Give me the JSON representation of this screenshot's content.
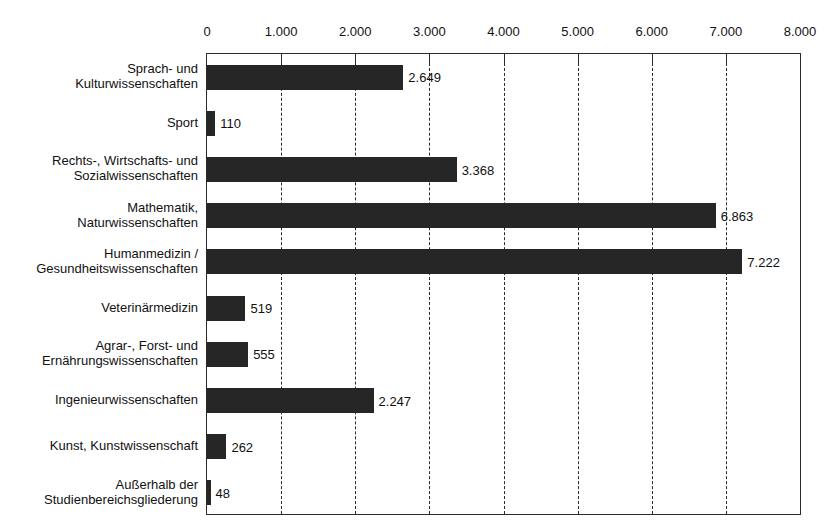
{
  "chart_data": {
    "type": "bar",
    "orientation": "horizontal",
    "title": "",
    "subtitle": "",
    "xlabel": "",
    "ylabel": "",
    "xlim": [
      0,
      8000
    ],
    "grid": true,
    "grid_axis": "x",
    "legend": false,
    "bar_color": "#262626",
    "frame_color": "#2a2a2a",
    "xticks": [
      0,
      1000,
      2000,
      3000,
      4000,
      5000,
      6000,
      7000,
      8000
    ],
    "xtick_labels": [
      "0",
      "1.000",
      "2.000",
      "3.000",
      "4.000",
      "5.000",
      "6.000",
      "7.000",
      "8.000"
    ],
    "categories": [
      "Sprach- und Kulturwissenschaften",
      "Sport",
      "Rechts-, Wirtschafts- und Sozialwissenschaften",
      "Mathematik, Naturwissenschaften",
      "Humanmedizin / Gesundheitswissenschaften",
      "Veterinärmedizin",
      "Agrar-, Forst- und Ernährungswissenschaften",
      "Ingenieurwissenschaften",
      "Kunst, Kunstwissenschaft",
      "Außerhalb der Studienbereichsgliederung"
    ],
    "category_lines": [
      [
        "Sprach- und",
        "Kulturwissenschaften"
      ],
      [
        "Sport"
      ],
      [
        "Rechts-, Wirtschafts- und",
        "Sozialwissenschaften"
      ],
      [
        "Mathematik,",
        "Naturwissenschaften"
      ],
      [
        "Humanmedizin /",
        "Gesundheitswissenschaften"
      ],
      [
        "Veterinärmedizin"
      ],
      [
        "Agrar-, Forst- und",
        "Ernährungswissenschaften"
      ],
      [
        "Ingenieurwissenschaften"
      ],
      [
        "Kunst, Kunstwissenschaft"
      ],
      [
        "Außerhalb der",
        "Studienbereichsgliederung"
      ]
    ],
    "values": [
      2649,
      110,
      3368,
      6863,
      7222,
      519,
      555,
      2247,
      262,
      48
    ],
    "value_labels": [
      "2.649",
      "110",
      "3.368",
      "6.863",
      "7.222",
      "519",
      "555",
      "2.247",
      "262",
      "48"
    ]
  }
}
